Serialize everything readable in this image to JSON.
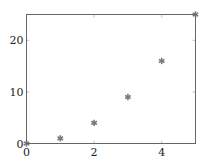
{
  "chart_data": {
    "type": "scatter",
    "title": "",
    "xlabel": "",
    "ylabel": "",
    "x": [
      0,
      1,
      2,
      3,
      4,
      5
    ],
    "series": [
      {
        "name": "",
        "values": [
          0,
          1,
          4,
          9,
          16,
          25
        ],
        "marker": "asterisk",
        "color": "#7a7a7a"
      }
    ],
    "xlim": [
      0,
      5
    ],
    "ylim": [
      0,
      25
    ],
    "xticks": [
      0,
      2,
      4
    ],
    "yticks": [
      0,
      10,
      20
    ],
    "grid": false,
    "legend": null
  },
  "axis_color": "#666666",
  "marker_color": "#7a7a7a"
}
